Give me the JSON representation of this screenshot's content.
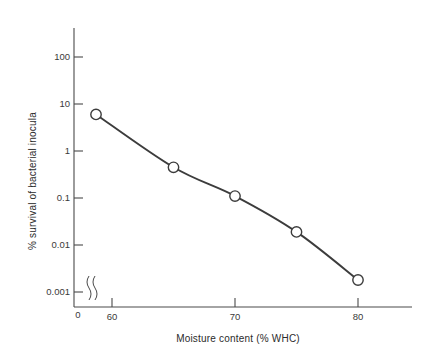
{
  "chart_data": {
    "type": "line",
    "title": "",
    "subtitle": "",
    "xlabel": "Moisture content (% WHC)",
    "ylabel": "% survival of bacterial inocula",
    "x": [
      58.7,
      65,
      70,
      75,
      80
    ],
    "values": [
      6.0,
      0.45,
      0.11,
      0.019,
      0.0018
    ],
    "series": [
      {
        "name": "% survival of bacterial inocula",
        "x": [
          58.7,
          65,
          70,
          75,
          80
        ],
        "values": [
          6.0,
          0.45,
          0.11,
          0.019,
          0.0018
        ]
      }
    ],
    "xlim": [
      56.5,
      82.5
    ],
    "ylim": [
      0.001,
      300
    ],
    "yscale": "log",
    "xscale": "linear",
    "grid": false,
    "legend": false,
    "legend_position": "none",
    "x_axis_break": true,
    "markers": "open-circle",
    "annotations": []
  },
  "axes": {
    "y": {
      "label": "% survival of bacterial inocula",
      "scale": "log",
      "ticks": [
        {
          "value": 100,
          "label": "100"
        },
        {
          "value": 10,
          "label": "10"
        },
        {
          "value": 1,
          "label": "1"
        },
        {
          "value": 0.1,
          "label": "0.1"
        },
        {
          "value": 0.01,
          "label": "0.01"
        },
        {
          "value": 0.001,
          "label": "0.001"
        }
      ]
    },
    "x": {
      "label": "Moisture content (% WHC)",
      "scale": "linear",
      "origin_label": "0",
      "ticks": [
        {
          "value": 60,
          "label": "60"
        },
        {
          "value": 70,
          "label": "70"
        },
        {
          "value": 80,
          "label": "80"
        }
      ]
    }
  },
  "colors": {
    "axis": "#4a4a4a",
    "curve": "#3c3c3c",
    "marker_fill": "#ffffff",
    "marker_stroke": "#3c3c3c",
    "text": "#2b2b2b",
    "background": "#ffffff"
  }
}
